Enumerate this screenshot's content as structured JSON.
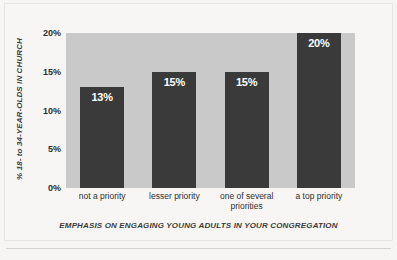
{
  "chart_data": {
    "type": "bar",
    "title": "",
    "xlabel": "EMPHASIS ON ENGAGING YOUNG ADULTS IN YOUR CONGREGATION",
    "ylabel": "% 18- to 34-YEAR-OLDS IN CHURCH",
    "categories": [
      "not a priority",
      "lesser priority",
      "one of several priorities",
      "a top priority"
    ],
    "category_lines": [
      [
        "not a priority"
      ],
      [
        "lesser priority"
      ],
      [
        "one of several",
        "priorities"
      ],
      [
        "a top priority"
      ]
    ],
    "values": [
      13,
      15,
      15,
      20
    ],
    "value_labels": [
      "13%",
      "15%",
      "15%",
      "20%"
    ],
    "ylim": [
      0,
      20
    ],
    "yticks": [
      20,
      15,
      10,
      5,
      0
    ],
    "ytick_labels": [
      "20%",
      "15%",
      "10%",
      "5%",
      "0%"
    ],
    "grid": false,
    "legend": null,
    "colors": {
      "bar": "#3a3a3a",
      "plot_background": "#c9c9c9",
      "page_background": "#f6f5f3",
      "value_label": "#ffffff",
      "axis_text": "#2e2e2e",
      "rule": "#d2d2d2"
    }
  }
}
